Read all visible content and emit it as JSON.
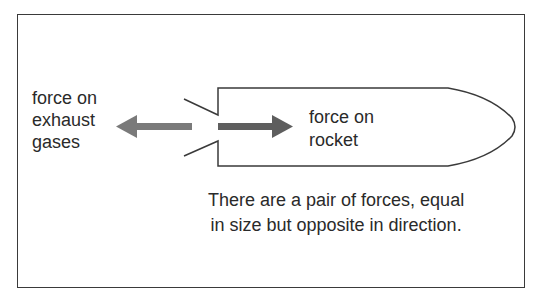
{
  "diagram": {
    "labels": {
      "exhaust": [
        "force on",
        "exhaust",
        "gases"
      ],
      "rocket": [
        "force on",
        "rocket"
      ]
    },
    "caption": [
      "There are a pair of forces, equal",
      "in size but opposite in direction."
    ],
    "colors": {
      "arrow_left": "#7a7a7a",
      "arrow_right": "#5e5e5e",
      "outline": "#3a3a3a",
      "text": "#2a2a2a"
    }
  }
}
